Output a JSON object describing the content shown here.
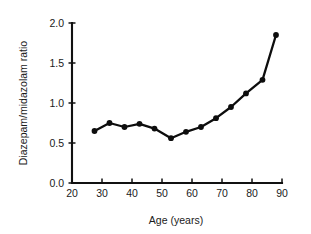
{
  "chart_data": {
    "type": "line",
    "title": "",
    "xlabel": "Age (years)",
    "ylabel": "Diazepam/midazolam ratio",
    "xlim": [
      20,
      90
    ],
    "ylim": [
      0.0,
      2.0
    ],
    "xticks": [
      20,
      30,
      40,
      50,
      60,
      70,
      80,
      90
    ],
    "xtick_labels": [
      "20",
      "30",
      "40",
      "50",
      "60",
      "70",
      "80",
      "90"
    ],
    "yticks": [
      0.0,
      0.5,
      1.0,
      1.5,
      2.0
    ],
    "ytick_labels": [
      "0.0",
      "0.5",
      "1.0",
      "1.5",
      "2.0"
    ],
    "grid": false,
    "legend": false,
    "marker": "filled-circle",
    "line_color": "#0d0d0d",
    "marker_color": "#0d0d0d",
    "x": [
      27.5,
      32.5,
      37.5,
      42.5,
      47.5,
      53.0,
      58.0,
      63.0,
      68.0,
      73.0,
      78.0,
      83.5,
      88.0
    ],
    "values": [
      0.65,
      0.75,
      0.7,
      0.74,
      0.68,
      0.56,
      0.64,
      0.7,
      0.81,
      0.95,
      1.12,
      1.29,
      1.85
    ],
    "series": [
      {
        "name": "Diazepam/midazolam ratio",
        "x": [
          27.5,
          32.5,
          37.5,
          42.5,
          47.5,
          53.0,
          58.0,
          63.0,
          68.0,
          73.0,
          78.0,
          83.5,
          88.0
        ],
        "values": [
          0.65,
          0.75,
          0.7,
          0.74,
          0.68,
          0.56,
          0.64,
          0.7,
          0.81,
          0.95,
          1.12,
          1.29,
          1.85
        ]
      }
    ]
  }
}
